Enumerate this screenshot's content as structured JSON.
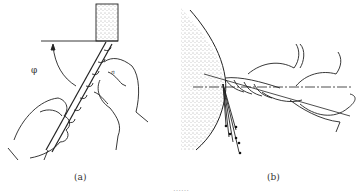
{
  "figure": {
    "panels": [
      {
        "id": "a",
        "label": "(a)",
        "angle_symbol": "φ",
        "direction_symbol": "n"
      },
      {
        "id": "b",
        "label": "(b)"
      }
    ],
    "caption": "……"
  }
}
